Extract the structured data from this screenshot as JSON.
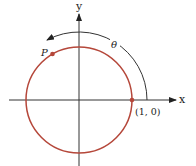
{
  "diagram": {
    "labels": {
      "y_axis": "y",
      "x_axis": "x",
      "point_p": "P",
      "theta": "θ",
      "point_one_zero": "(1, 0)"
    },
    "geometry": {
      "center": [
        79,
        100
      ],
      "circle_radius": 53,
      "angle_arc_radius": 68,
      "point_p_angle_deg": 120,
      "arc_end_angle_deg": 118
    },
    "colors": {
      "circle": "#b5473a",
      "point": "#b5473a",
      "axes": "#333333",
      "arc": "#333333"
    }
  }
}
